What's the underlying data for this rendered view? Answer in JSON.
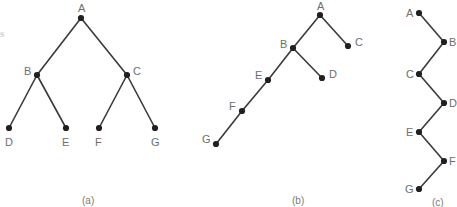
{
  "figure": {
    "background_color": "#ffffff",
    "node_color": "#231f20",
    "edge_color": "#3a3a3a",
    "label_color": "#6e6e6e",
    "caption_color": "#7a7a7a",
    "edge_fragment_text": "s",
    "width": 457,
    "height": 207
  },
  "chart_data": {
    "type": "diagram",
    "title": "",
    "subtitle": "",
    "xlabel": "",
    "ylabel": "",
    "panels": [
      {
        "caption": "(a)",
        "caption_pos": [
          82,
          196
        ],
        "description": "balanced binary tree",
        "nodes": [
          {
            "id": "A",
            "label": "A",
            "x": 81,
            "y": 18,
            "label_x": 78,
            "label_y": 3
          },
          {
            "id": "B",
            "label": "B",
            "x": 37,
            "y": 75,
            "label_x": 24,
            "label_y": 66
          },
          {
            "id": "C",
            "label": "C",
            "x": 127,
            "y": 75,
            "label_x": 133,
            "label_y": 66
          },
          {
            "id": "D",
            "label": "D",
            "x": 9,
            "y": 128,
            "label_x": 5,
            "label_y": 137
          },
          {
            "id": "E",
            "label": "E",
            "x": 66,
            "y": 128,
            "label_x": 62,
            "label_y": 137
          },
          {
            "id": "F",
            "label": "F",
            "x": 99,
            "y": 128,
            "label_x": 95,
            "label_y": 137
          },
          {
            "id": "G",
            "label": "G",
            "x": 155,
            "y": 128,
            "label_x": 151,
            "label_y": 137
          }
        ],
        "edges": [
          {
            "from": "A",
            "to": "B"
          },
          {
            "from": "A",
            "to": "C"
          },
          {
            "from": "B",
            "to": "D"
          },
          {
            "from": "B",
            "to": "E"
          },
          {
            "from": "C",
            "to": "F"
          },
          {
            "from": "C",
            "to": "G"
          }
        ]
      },
      {
        "caption": "(b)",
        "caption_pos": [
          292,
          196
        ],
        "description": "left-skewed tree with chain",
        "nodes": [
          {
            "id": "A",
            "label": "A",
            "x": 320,
            "y": 15,
            "label_x": 317,
            "label_y": 1
          },
          {
            "id": "B",
            "label": "B",
            "x": 293,
            "y": 48,
            "label_x": 280,
            "label_y": 39
          },
          {
            "id": "C",
            "label": "C",
            "x": 348,
            "y": 46,
            "label_x": 355,
            "label_y": 37
          },
          {
            "id": "D",
            "label": "D",
            "x": 322,
            "y": 78,
            "label_x": 329,
            "label_y": 69
          },
          {
            "id": "E",
            "label": "E",
            "x": 268,
            "y": 80,
            "label_x": 255,
            "label_y": 70
          },
          {
            "id": "F",
            "label": "F",
            "x": 242,
            "y": 111,
            "label_x": 229,
            "label_y": 101
          },
          {
            "id": "G",
            "label": "G",
            "x": 216,
            "y": 144,
            "label_x": 202,
            "label_y": 134
          }
        ],
        "edges": [
          {
            "from": "A",
            "to": "B"
          },
          {
            "from": "A",
            "to": "C"
          },
          {
            "from": "B",
            "to": "D"
          },
          {
            "from": "B",
            "to": "E"
          },
          {
            "from": "E",
            "to": "F"
          },
          {
            "from": "F",
            "to": "G"
          }
        ]
      },
      {
        "caption": "(c)",
        "caption_pos": [
          432,
          198
        ],
        "description": "zigzag chain",
        "nodes": [
          {
            "id": "A",
            "label": "A",
            "x": 419,
            "y": 13,
            "label_x": 406,
            "label_y": 8
          },
          {
            "id": "B",
            "label": "B",
            "x": 444,
            "y": 42,
            "label_x": 449,
            "label_y": 37
          },
          {
            "id": "C",
            "label": "C",
            "x": 419,
            "y": 74,
            "label_x": 406,
            "label_y": 69
          },
          {
            "id": "D",
            "label": "D",
            "x": 444,
            "y": 103,
            "label_x": 449,
            "label_y": 98
          },
          {
            "id": "E",
            "label": "E",
            "x": 419,
            "y": 132,
            "label_x": 406,
            "label_y": 127
          },
          {
            "id": "F",
            "label": "F",
            "x": 444,
            "y": 161,
            "label_x": 449,
            "label_y": 156
          },
          {
            "id": "G",
            "label": "G",
            "x": 419,
            "y": 189,
            "label_x": 405,
            "label_y": 184
          }
        ],
        "edges": [
          {
            "from": "A",
            "to": "B"
          },
          {
            "from": "B",
            "to": "C"
          },
          {
            "from": "C",
            "to": "D"
          },
          {
            "from": "D",
            "to": "E"
          },
          {
            "from": "E",
            "to": "F"
          },
          {
            "from": "F",
            "to": "G"
          }
        ]
      }
    ]
  }
}
